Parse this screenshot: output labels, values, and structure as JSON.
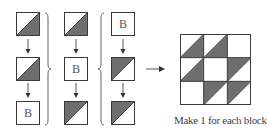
{
  "diagram": {
    "type": "quilt-block-assembly",
    "colors": {
      "dark": "#6e6e6e",
      "line": "#3a3a3a",
      "background": "#ffffff",
      "text": "#444444"
    },
    "columns": [
      {
        "squares": [
          {
            "kind": "hst",
            "dark": "bottom-right"
          },
          {
            "kind": "hst",
            "dark": "bottom-right"
          },
          {
            "kind": "plain",
            "label": "B"
          }
        ]
      },
      {
        "squares": [
          {
            "kind": "hst",
            "dark": "bottom-right"
          },
          {
            "kind": "plain",
            "label": "B"
          },
          {
            "kind": "hst",
            "dark": "top-left"
          }
        ]
      },
      {
        "squares": [
          {
            "kind": "plain",
            "label": "B"
          },
          {
            "kind": "hst",
            "dark": "top-left"
          },
          {
            "kind": "hst",
            "dark": "top-left"
          }
        ]
      }
    ],
    "brace_label": "}",
    "result_grid": [
      [
        "bottom-right",
        "bottom-right",
        "plain"
      ],
      [
        "bottom-right",
        "plain",
        "top-left"
      ],
      [
        "plain",
        "top-left",
        "top-left"
      ]
    ],
    "caption": "Make 1 for each block."
  }
}
